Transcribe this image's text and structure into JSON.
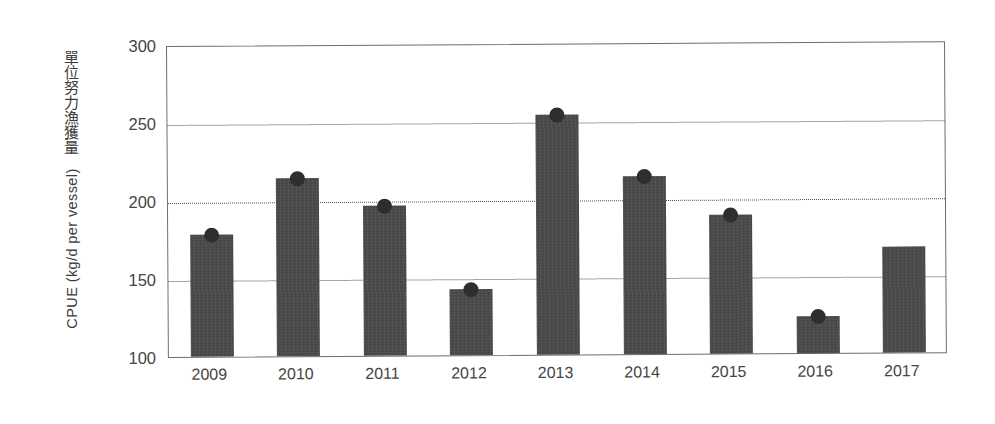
{
  "chart_data": {
    "type": "bar",
    "title": "",
    "xlabel": "",
    "ylabel_cjk": "單位努力漁獲量",
    "ylabel_latin": "CPUE (kg/d per vessel)",
    "categories": [
      "2009",
      "2010",
      "2011",
      "2012",
      "2013",
      "2014",
      "2015",
      "2016",
      "2017"
    ],
    "values": [
      178,
      214,
      196,
      142,
      254,
      214,
      189,
      124,
      168
    ],
    "markers": [
      true,
      true,
      true,
      true,
      true,
      true,
      true,
      true,
      false
    ],
    "marker_shape": "circle",
    "ylim": [
      100,
      300
    ],
    "yticks": [
      300,
      250,
      200,
      150,
      100
    ],
    "ytick_labels": [
      "300",
      "250",
      "200",
      "150",
      "100"
    ],
    "gridlines_at": [
      250,
      200,
      150
    ],
    "grid": "horizontal-dotted",
    "legend": "none",
    "bar_color": "#474747",
    "marker_color": "#2e2e2e",
    "grid_color": "#4a4a4a",
    "axis_color": "#6f6f6f",
    "text_color": "#454545",
    "background": "#ffffff"
  }
}
